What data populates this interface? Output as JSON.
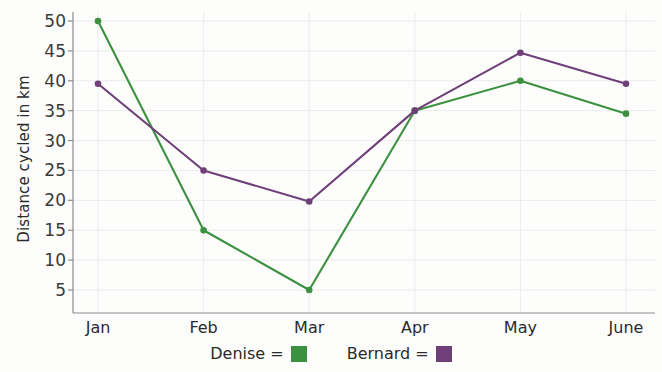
{
  "chart_data": {
    "type": "line",
    "title": "",
    "subtitle": "",
    "xlabel": "",
    "ylabel": "Distance cycled in km",
    "categories": [
      "Jan",
      "Feb",
      "Mar",
      "Apr",
      "May",
      "June"
    ],
    "series": [
      {
        "name": "Denise",
        "color": "#3c9140",
        "values": [
          50,
          15,
          5,
          35,
          40,
          34.5
        ]
      },
      {
        "name": "Bernard",
        "color": "#6e3f78",
        "values": [
          39.5,
          25,
          19.8,
          35,
          44.7,
          39.5
        ]
      }
    ],
    "ylim": [
      0,
      51
    ],
    "yticks": [
      5,
      10,
      15,
      20,
      25,
      30,
      35,
      40,
      45,
      50
    ],
    "ytick_labels": [
      "5",
      "10",
      "15",
      "20",
      "25",
      "30",
      "35",
      "40",
      "45",
      "50"
    ],
    "grid": true,
    "grid_color": "#eceaee",
    "axis_color": "#8c8c8c",
    "legend_position": "bottom",
    "marker": "circle",
    "legend": [
      {
        "label": "Denise =",
        "color": "#3c9140"
      },
      {
        "label": "Bernard =",
        "color": "#6e3f78"
      }
    ]
  }
}
